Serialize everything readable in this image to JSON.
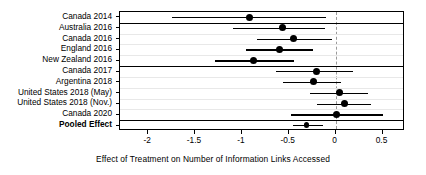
{
  "chart_data": {
    "type": "scatter",
    "subtype": "forest-plot",
    "title": "",
    "xlabel": "Effect of Treatment on Number of Information Links Accessed",
    "ylabel": "",
    "xlim": [
      -2.3,
      0.74
    ],
    "xticks": [
      -2,
      -1.5,
      -1,
      -0.5,
      0,
      0.5
    ],
    "xticklabels": [
      "-2",
      "-1.5",
      "-1",
      "-0.5",
      "0",
      "0.5"
    ],
    "reference_line": 0,
    "reference_line_style": "dashed",
    "grid": true,
    "legend": "none",
    "categories": [
      "Canada 2014",
      "Australia 2016",
      "Canada 2016",
      "England 2016",
      "New Zealand 2016",
      "Canada 2017",
      "Argentina 2018",
      "United States 2018 (May)",
      "United States 2018 (Nov.)",
      "Canada 2020",
      "Pooled Effect"
    ],
    "rows": [
      {
        "label": "Canada 2014",
        "estimate": -0.92,
        "ci_low": -1.75,
        "ci_high": -0.1,
        "group": 1,
        "pooled": false
      },
      {
        "label": "Australia 2016",
        "estimate": -0.57,
        "ci_low": -1.09,
        "ci_high": -0.11,
        "group": 2,
        "pooled": false
      },
      {
        "label": "Canada 2016",
        "estimate": -0.45,
        "ci_low": -0.84,
        "ci_high": -0.04,
        "group": 2,
        "pooled": false
      },
      {
        "label": "England 2016",
        "estimate": -0.6,
        "ci_low": -0.96,
        "ci_high": -0.24,
        "group": 2,
        "pooled": false
      },
      {
        "label": "New Zealand 2016",
        "estimate": -0.88,
        "ci_low": -1.29,
        "ci_high": -0.44,
        "group": 2,
        "pooled": false
      },
      {
        "label": "Canada 2017",
        "estimate": -0.2,
        "ci_low": -0.64,
        "ci_high": 0.19,
        "group": 3,
        "pooled": false
      },
      {
        "label": "Argentina 2018",
        "estimate": -0.24,
        "ci_low": -0.56,
        "ci_high": 0.06,
        "group": 3,
        "pooled": false
      },
      {
        "label": "United States 2018 (May)",
        "estimate": 0.04,
        "ci_low": -0.27,
        "ci_high": 0.35,
        "group": 3,
        "pooled": false
      },
      {
        "label": "United States 2018 (Nov.)",
        "estimate": 0.09,
        "ci_low": -0.2,
        "ci_high": 0.38,
        "group": 3,
        "pooled": false
      },
      {
        "label": "Canada 2020",
        "estimate": 0.01,
        "ci_low": -0.48,
        "ci_high": 0.51,
        "group": 3,
        "pooled": false
      },
      {
        "label": "Pooled Effect",
        "estimate": -0.31,
        "ci_low": -0.46,
        "ci_high": -0.13,
        "group": 4,
        "pooled": true
      }
    ],
    "group_separators_after": [
      "Canada 2014",
      "New Zealand 2016",
      "Canada 2020"
    ],
    "colors": {
      "point": "#000000",
      "ci": "#000000",
      "frame": "#000000",
      "grid": "#e8e8e8",
      "reference": "#9a9a9a",
      "background": "#ffffff"
    }
  }
}
